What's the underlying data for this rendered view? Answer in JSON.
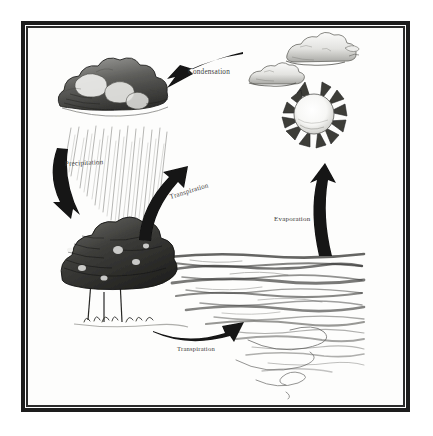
{
  "figure": {
    "medium": "pencil sketch",
    "frame_color": "#1d1d1d",
    "background_color": "#ffffff",
    "paper_color": "#fdfdfc",
    "ink_color": "#111111"
  },
  "labels": {
    "condensation": "Condensation",
    "precipitation": "Precipitation",
    "transpiration_mid": "Transpiration",
    "evaporation": "Evaporation",
    "transpiration_bottom": "Transpiration"
  },
  "arrows": [
    {
      "name": "condensation-arrow",
      "label": "Condensation",
      "direction": "right-to-left",
      "from": "clouds",
      "to": "rain-cloud",
      "color": "#141414"
    },
    {
      "name": "precipitation-arrow",
      "label": "Precipitation",
      "direction": "downward",
      "from": "rain-cloud",
      "to": "trees",
      "color": "#141414"
    },
    {
      "name": "transpiration-arrow-middle",
      "label": "Transpiration",
      "direction": "upward-right",
      "from": "trees",
      "to": "clouds",
      "color": "#141414"
    },
    {
      "name": "evaporation-arrow",
      "label": "Evaporation",
      "direction": "upward",
      "from": "water",
      "to": "sun",
      "color": "#141414"
    },
    {
      "name": "transpiration-arrow-bottom",
      "label": "Transpiration",
      "direction": "left-to-right",
      "from": "trees",
      "to": "water",
      "color": "#141414"
    }
  ],
  "elements": [
    {
      "name": "rain-cloud",
      "description": "Dark shaded storm cloud with falling rain streaks",
      "position": "upper-left"
    },
    {
      "name": "cloud-small",
      "description": "Light fluffy cloud",
      "position": "upper-right"
    },
    {
      "name": "cloud-large",
      "description": "Light fluffy cloud",
      "position": "top-right"
    },
    {
      "name": "sun",
      "description": "Sun with spiked triangular rays and bright round center",
      "position": "right"
    },
    {
      "name": "trees",
      "description": "Dense dark cluster of leafy trees with grass",
      "position": "lower-left"
    },
    {
      "name": "water",
      "description": "Body of water drawn as horizontal wavy strokes",
      "position": "lower-right"
    }
  ]
}
